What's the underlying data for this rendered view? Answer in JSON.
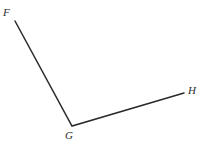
{
  "figure": {
    "kind": "geometry-angle-diagram",
    "width": 205,
    "height": 155,
    "background_color": "#ffffff",
    "stroke_color": "#2b2b2b",
    "stroke_width": 1.5,
    "label_color": "#2b2b2b"
  },
  "labels": {
    "f": "F",
    "g": "G",
    "h": "H"
  },
  "chart_data": {
    "type": "scatter",
    "title": "",
    "xlabel": "",
    "ylabel": "",
    "xlim": [
      0,
      205
    ],
    "ylim": [
      0,
      155
    ],
    "grid": false,
    "legend": "none",
    "points": [
      {
        "name": "F",
        "x": 15,
        "y": 21,
        "label": "F",
        "label_x": 7,
        "label_y": 13
      },
      {
        "name": "G",
        "x": 72,
        "y": 126,
        "label": "G",
        "label_x": 69,
        "label_y": 136
      },
      {
        "name": "H",
        "x": 184,
        "y": 93,
        "label": "H",
        "label_x": 192,
        "label_y": 91
      }
    ],
    "series": [
      {
        "name": "ray-GF",
        "x": [
          72,
          15
        ],
        "y": [
          126,
          21
        ]
      },
      {
        "name": "ray-GH",
        "x": [
          72,
          184
        ],
        "y": [
          126,
          93
        ]
      }
    ],
    "annotations": [
      {
        "text": "F",
        "x": 7,
        "y": 13
      },
      {
        "text": "G",
        "x": 69,
        "y": 136
      },
      {
        "text": "H",
        "x": 192,
        "y": 91
      }
    ]
  }
}
